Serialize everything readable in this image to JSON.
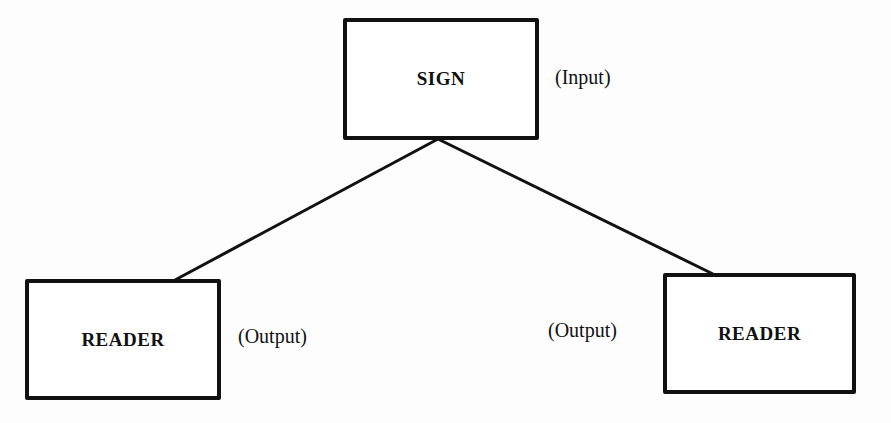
{
  "diagram": {
    "nodes": [
      {
        "id": "sign",
        "label": "SIGN",
        "role_label": "(Input)"
      },
      {
        "id": "reader_left",
        "label": "READER",
        "role_label": "(Output)"
      },
      {
        "id": "reader_right",
        "label": "READER",
        "role_label": "(Output)"
      }
    ],
    "edges": [
      {
        "from": "sign",
        "to": "reader_left"
      },
      {
        "from": "sign",
        "to": "reader_right"
      }
    ],
    "colors": {
      "stroke": "#111111",
      "background": "#fdfdfd"
    }
  }
}
